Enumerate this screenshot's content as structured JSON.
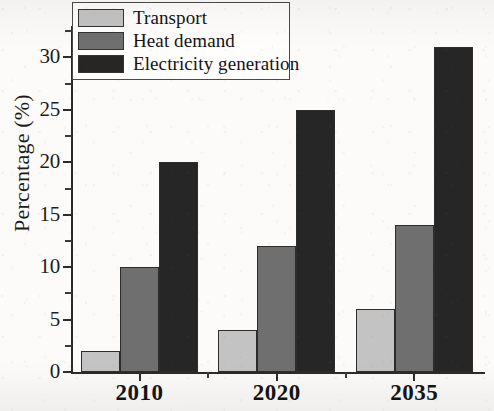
{
  "chart_data": {
    "type": "bar",
    "title": "",
    "xlabel": "",
    "ylabel": "Percentage (%)",
    "categories": [
      "2010",
      "2020",
      "2035"
    ],
    "series": [
      {
        "name": "Transport",
        "values": [
          2,
          4,
          6
        ],
        "color": "#c3c3c3"
      },
      {
        "name": "Heat demand",
        "values": [
          10,
          12,
          14
        ],
        "color": "#6f6f6f"
      },
      {
        "name": "Electricity generation",
        "values": [
          20,
          25,
          31
        ],
        "color": "#262626"
      }
    ],
    "ylim": [
      0,
      33
    ],
    "yticks": [
      0,
      5,
      10,
      15,
      20,
      25,
      30
    ],
    "yticks_minor": [
      2.5,
      7.5,
      12.5,
      17.5,
      22.5,
      27.5,
      32.5
    ],
    "ytick_labels": [
      "0",
      "5",
      "10",
      "15",
      "20",
      "25",
      "30"
    ],
    "grid": false,
    "legend_position": "top-left"
  },
  "legend": {
    "entries": [
      {
        "label": "Transport"
      },
      {
        "label": "Heat demand"
      },
      {
        "label": "Electricity generation"
      }
    ]
  },
  "axes": {
    "y_title": "Percentage (%)"
  }
}
